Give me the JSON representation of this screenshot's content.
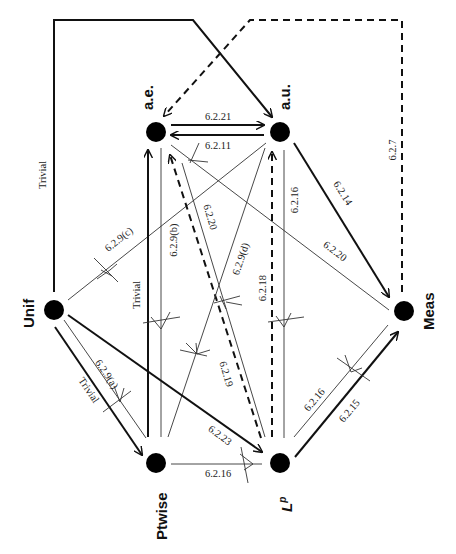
{
  "diagram": {
    "type": "implication-diagram",
    "orientation": "rotated 90° (labels read bottom-to-top)",
    "nodes": [
      {
        "id": "ae",
        "label": "a.e.",
        "x": 156,
        "y": 132
      },
      {
        "id": "au",
        "label": "a.u.",
        "x": 280,
        "y": 132
      },
      {
        "id": "unif",
        "label": "Unif",
        "x": 54,
        "y": 310
      },
      {
        "id": "meas",
        "label": "Meas",
        "x": 404,
        "y": 310
      },
      {
        "id": "ptwise",
        "label": "Ptwise",
        "x": 156,
        "y": 463
      },
      {
        "id": "lp",
        "label": "L^p",
        "x": 280,
        "y": 463
      }
    ],
    "edges": [
      {
        "from": "unif",
        "to": "au",
        "label": "Trivial",
        "style": "thick",
        "route": "up-left-frame"
      },
      {
        "from": "meas",
        "to": "ae",
        "label": "6.2.7",
        "style": "dashed",
        "route": "up-right-frame"
      },
      {
        "from": "ae",
        "to": "au",
        "label": "6.2.21",
        "style": "thick"
      },
      {
        "from": "au",
        "to": "ae",
        "label": "6.2.11",
        "style": "thick"
      },
      {
        "from": "ae",
        "to": "meas",
        "label": "6.2.20",
        "style": "thin",
        "negated": false
      },
      {
        "from": "au",
        "to": "meas",
        "label": "6.2.14",
        "style": "thick"
      },
      {
        "from": "au",
        "to": "lp",
        "label": "6.2.16",
        "style": "thin",
        "negated": true
      },
      {
        "from": "lp",
        "to": "au",
        "label": "6.2.18",
        "style": "dashed"
      },
      {
        "from": "unif",
        "to": "au",
        "label": "6.2.9(c)",
        "style": "thin",
        "negated": true
      },
      {
        "from": "ptwise",
        "to": "ae",
        "label": "Trivial",
        "style": "thick"
      },
      {
        "from": "ae",
        "to": "ptwise",
        "label": "6.2.9(b)",
        "style": "thin",
        "negated": true
      },
      {
        "from": "ae",
        "to": "lp",
        "label": "6.2.20",
        "style": "thin",
        "negated": true
      },
      {
        "from": "lp",
        "to": "ae",
        "label": "6.2.19",
        "style": "dashed"
      },
      {
        "from": "ptwise",
        "to": "au",
        "label": "6.2.9(d)",
        "style": "thin",
        "negated": true
      },
      {
        "from": "unif",
        "to": "ptwise",
        "label": "Trivial",
        "style": "thick"
      },
      {
        "from": "ptwise",
        "to": "unif",
        "label": "6.2.9(a)",
        "style": "thin",
        "negated": true
      },
      {
        "from": "unif",
        "to": "lp",
        "label": "6.2.23",
        "style": "thick"
      },
      {
        "from": "ptwise",
        "to": "lp",
        "label": "6.2.16",
        "style": "thin",
        "negated": true
      },
      {
        "from": "lp",
        "to": "meas",
        "label": "6.2.15",
        "style": "thick"
      },
      {
        "from": "meas",
        "to": "lp",
        "label": "6.2.16",
        "style": "thin",
        "negated": true
      }
    ],
    "labels": {
      "ae": "a.e.",
      "au": "a.u.",
      "unif": "Unif",
      "meas": "Meas",
      "ptwise": "Ptwise",
      "lp_base": "L",
      "lp_sup": "p",
      "trivial_frame": "Trivial",
      "trivial_ptwise_ae": "Trivial",
      "trivial_unif_ptwise": "Trivial",
      "e_6_2_7": "6.2.7",
      "e_6_2_21": "6.2.21",
      "e_6_2_11": "6.2.11",
      "e_6_2_20_meas": "6.2.20",
      "e_6_2_14": "6.2.14",
      "e_6_2_16_aulp": "6.2.16",
      "e_6_2_18": "6.2.18",
      "e_6_2_9c": "6.2.9(c)",
      "e_6_2_9b": "6.2.9(b)",
      "e_6_2_20_lp": "6.2.20",
      "e_6_2_19": "6.2.19",
      "e_6_2_9d": "6.2.9(d)",
      "e_6_2_9a": "6.2.9(a)",
      "e_6_2_23": "6.2.23",
      "e_6_2_16_ptlp": "6.2.16",
      "e_6_2_15": "6.2.15",
      "e_6_2_16_measlp": "6.2.16"
    }
  }
}
